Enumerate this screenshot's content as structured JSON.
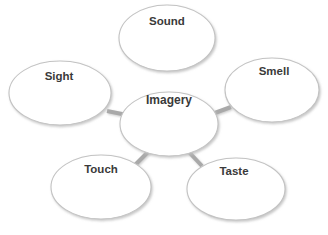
{
  "diagram": {
    "type": "concept-map",
    "background_color": "#ffffff",
    "style": {
      "node_fill": "#ffffff",
      "node_stroke": "#c3c3c3",
      "node_stroke_width": 1.1,
      "node_shadow_color": "#d9d9d9",
      "connector_color": "#a9a9a9",
      "connector_width": 4,
      "label_color": "#3a3a3a"
    },
    "center": {
      "id": "imagery",
      "label": "Imagery",
      "cx": 169,
      "cy": 124,
      "rx": 49,
      "ry": 32,
      "label_x": 169,
      "label_y": 101,
      "font_size": 12
    },
    "nodes": [
      {
        "id": "sound",
        "label": "Sound",
        "cx": 167,
        "cy": 38,
        "rx": 48,
        "ry": 33,
        "label_x": 167,
        "label_y": 22,
        "font_size": 11.5
      },
      {
        "id": "smell",
        "label": "Smell",
        "cx": 272,
        "cy": 90,
        "rx": 47,
        "ry": 32,
        "label_x": 274,
        "label_y": 72,
        "font_size": 11.5
      },
      {
        "id": "sight",
        "label": "Sight",
        "cx": 60,
        "cy": 93,
        "rx": 51,
        "ry": 32,
        "label_x": 59,
        "label_y": 77,
        "font_size": 11.5
      },
      {
        "id": "touch",
        "label": "Touch",
        "cx": 101,
        "cy": 187,
        "rx": 50,
        "ry": 32,
        "label_x": 101,
        "label_y": 170,
        "font_size": 11.5
      },
      {
        "id": "taste",
        "label": "Taste",
        "cx": 236,
        "cy": 189,
        "rx": 49,
        "ry": 31,
        "label_x": 234,
        "label_y": 172,
        "font_size": 11.5
      }
    ],
    "connectors": [
      {
        "id": "imagery-sound",
        "from": "imagery",
        "to": "sound",
        "x1": 168,
        "y1": 71,
        "x2": 168,
        "y2": 95
      },
      {
        "id": "imagery-sight",
        "from": "imagery",
        "to": "sight",
        "x1": 107,
        "y1": 111,
        "x2": 127,
        "y2": 115
      },
      {
        "id": "imagery-smell",
        "from": "imagery",
        "to": "smell",
        "x1": 212,
        "y1": 114,
        "x2": 231,
        "y2": 107
      },
      {
        "id": "imagery-touch",
        "from": "imagery",
        "to": "touch",
        "x1": 150,
        "y1": 150,
        "x2": 135,
        "y2": 165
      },
      {
        "id": "imagery-taste",
        "from": "imagery",
        "to": "taste",
        "x1": 187,
        "y1": 150,
        "x2": 202,
        "y2": 166
      }
    ]
  }
}
